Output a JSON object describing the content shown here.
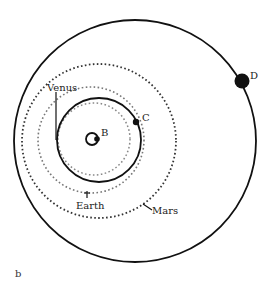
{
  "diagram": {
    "panel_label": "b",
    "colors": {
      "solid": "#111111",
      "mars_dotted": "#333333",
      "earth_dotted": "#777777",
      "venus_dotted": "#888888",
      "background": "#ffffff"
    },
    "labels": {
      "venus": "Venus",
      "earth": "Earth",
      "mars": "Mars",
      "point_b": "B",
      "point_c": "C",
      "point_d": "D"
    },
    "orbits": [
      {
        "name": "outer-solid-orbit",
        "style": "solid"
      },
      {
        "name": "mars-orbit",
        "style": "dotted"
      },
      {
        "name": "earth-orbit",
        "style": "dotted"
      },
      {
        "name": "venus-orbit",
        "style": "dotted"
      },
      {
        "name": "transfer-orbit",
        "style": "solid"
      },
      {
        "name": "central-small-orbit",
        "style": "solid"
      }
    ]
  }
}
